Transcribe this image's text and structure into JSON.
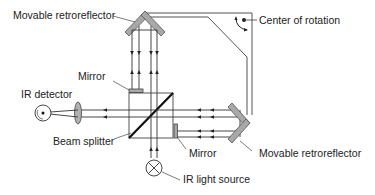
{
  "diagram": {
    "labels": {
      "top_retroreflector": "Movable retroreflector",
      "center_of_rotation": "Center of rotation",
      "top_mirror": "Mirror",
      "ir_detector": "IR detector",
      "beam_splitter": "Beam splitter",
      "right_mirror": "Mirror",
      "right_retroreflector": "Movable retroreflector",
      "ir_light_source": "IR light source"
    },
    "colors": {
      "line": "#333333",
      "frame": "#555555",
      "reflector_fill": "#a8a8a8",
      "lens_fill": "#b0b0b0",
      "text": "#222222"
    }
  }
}
